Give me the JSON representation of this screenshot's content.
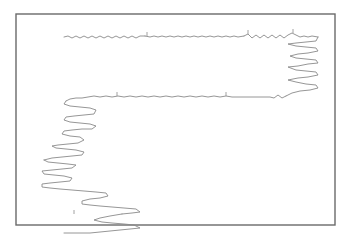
{
  "diagram": {
    "type": "polymer-chain-trace",
    "colors": {
      "background": "#ffffff",
      "frame": "#6a6a6a",
      "chain": "#8a8a8a"
    },
    "frame": {
      "x": 16,
      "y": 14,
      "width": 319,
      "height": 211
    },
    "segments": [
      {
        "name": "top-strand-wavy-left",
        "points": "64,37 68,36 72,38 76,36 80,38 84,36 88,38 92,36 96,38 100,36 104,38 108,36 112,38 116,36 120,38 124,36 128,38 132,36 136,38 140,36 145,36"
      },
      {
        "name": "top-strand-fine",
        "points": "145,36 150,37 154,36 158,37 162,36 166,37 170,36 174,37 178,36 182,37 186,36 190,37 194,36 198,37 202,36 206,37 210,36 214,37 218,36 222,37 226,36 230,37 234,36 238,37 244,36"
      },
      {
        "name": "top-strand-wavy-right",
        "points": "244,36 248,34 252,38 256,35 260,38 264,35 268,38 272,35 276,38 280,35 284,38 288,35 292,33 296,35 300,37 304,36 308,37 312,36 318,37"
      },
      {
        "name": "right-zigzag",
        "points": "318,37 316,41 306,42 296,43 288,44 296,46 306,47 316,48 318,51 308,53 298,54 290,56 296,58 306,59 316,60 318,63 308,64 298,66 288,67 296,70 306,71 316,72 318,75 308,77 298,78 288,80 296,82 306,84 316,85 318,88 310,90 300,91 292,93 286,96"
      },
      {
        "name": "middle-strand",
        "points": "286,96 282,98 278,95 274,98 270,97 260,97 250,97 240,97 232,97 226,96 220,97 214,96 208,97 202,96 196,97 190,96 184,97 178,96 172,97 166,96 160,97 154,96 148,97 142,96 136,97 130,96 124,97 118,96 112,97 106,96 100,97 94,96 88,97 82,98 76,98 70,99 66,101"
      },
      {
        "name": "left-zigzag-upper",
        "points": "66,101 64,104 70,106 80,107 90,108 96,110 94,114 84,115 74,116 66,117 64,120 70,122 80,123 90,124 96,126 92,129 82,129 72,130 64,131 62,134 70,136 80,137 84,140 78,143 68,144 58,145 52,146 56,148 66,149 76,150 84,152 82,155 72,156 62,157 52,158 44,160"
      },
      {
        "name": "left-zigzag-lower",
        "points": "44,160 48,162 58,163 68,164 76,165 72,168 62,169 52,170 42,171 44,174 54,175 64,176 72,178 70,181 60,182 50,183 42,184 42,187 50,188 60,189 72,190 84,191 96,192 106,193 108,196 100,198 90,199 82,201 82,204 90,205 100,206 112,207 124,208 136,209 140,212 132,213 122,214"
      },
      {
        "name": "bottom-tail",
        "points": "122,214 110,216 100,218 94,220 102,222 112,223 124,224 134,225 140,228 130,229 120,230 110,231 100,232 90,233 78,233 64,233"
      }
    ],
    "ticks": [
      {
        "x": 147,
        "y1": 32,
        "y2": 36
      },
      {
        "x": 248,
        "y1": 30,
        "y2": 34
      },
      {
        "x": 293,
        "y1": 29,
        "y2": 33
      },
      {
        "x": 117,
        "y1": 92,
        "y2": 96
      },
      {
        "x": 226,
        "y1": 92,
        "y2": 96
      },
      {
        "x": 74,
        "y1": 210,
        "y2": 214
      }
    ]
  }
}
